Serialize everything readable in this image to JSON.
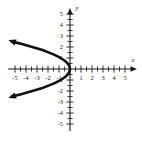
{
  "figure": {
    "title": "",
    "background_color": "#ffffff",
    "curve_color": "#111111",
    "axis_color": "#1a1a1a"
  },
  "chart_data": {
    "type": "line",
    "title": "",
    "xlabel": "x",
    "ylabel": "y",
    "xlim": [
      -5.6,
      5.6
    ],
    "ylim": [
      -5.5,
      5.5
    ],
    "grid": false,
    "legend": "none",
    "x_tick_labels": [
      "-5",
      "-4",
      "-3",
      "-2",
      "-1",
      "1",
      "2",
      "3",
      "4",
      "5"
    ],
    "x_tick_values": [
      -5,
      -4,
      -3,
      -2,
      -1,
      1,
      2,
      3,
      4,
      5
    ],
    "y_tick_labels": [
      "5",
      "4",
      "3",
      "2",
      "1",
      "-1",
      "-2",
      "-3",
      "-4",
      "-5"
    ],
    "y_tick_values": [
      5,
      4,
      3,
      2,
      1,
      -1,
      -2,
      -3,
      -4,
      -5
    ],
    "minor_tick_step": 0.5,
    "axis_arrows": [
      "x-positive",
      "y-positive"
    ],
    "series": [
      {
        "name": "parabola",
        "equation": "x = -0.85 y^2",
        "opens": "left",
        "vertex": [
          0,
          0
        ],
        "arrowheads": [
          "start",
          "end"
        ],
        "x": [
          -5.3,
          -4.6,
          -3.9,
          -3.2,
          -2.5,
          -1.9,
          -1.4,
          -0.95,
          -0.6,
          -0.34,
          -0.15,
          -0.04,
          0,
          -0.04,
          -0.15,
          -0.34,
          -0.6,
          -0.95,
          -1.4,
          -1.9,
          -2.5,
          -3.2,
          -3.9,
          -4.6,
          -5.3
        ],
        "y": [
          2.5,
          2.33,
          2.14,
          1.94,
          1.72,
          1.49,
          1.28,
          1.06,
          0.84,
          0.63,
          0.42,
          0.22,
          0,
          -0.22,
          -0.42,
          -0.63,
          -0.84,
          -1.06,
          -1.28,
          -1.49,
          -1.72,
          -1.94,
          -2.14,
          -2.33,
          -2.5
        ]
      }
    ]
  },
  "labels": {
    "x_axis_name": "x",
    "y_axis_name": "y",
    "x5n": "-5",
    "x4n": "-4",
    "x3n": "-3",
    "x2n": "-2",
    "x1n": "-1",
    "x1": "1",
    "x2": "2",
    "x3": "3",
    "x4": "4",
    "x5": "5",
    "y5": "5",
    "y4": "4",
    "y3": "3",
    "y2": "2",
    "y1": "1",
    "y1n": "-1",
    "y2n": "-2",
    "y3n": "-3",
    "y4n": "-4",
    "y5n": "-5"
  }
}
